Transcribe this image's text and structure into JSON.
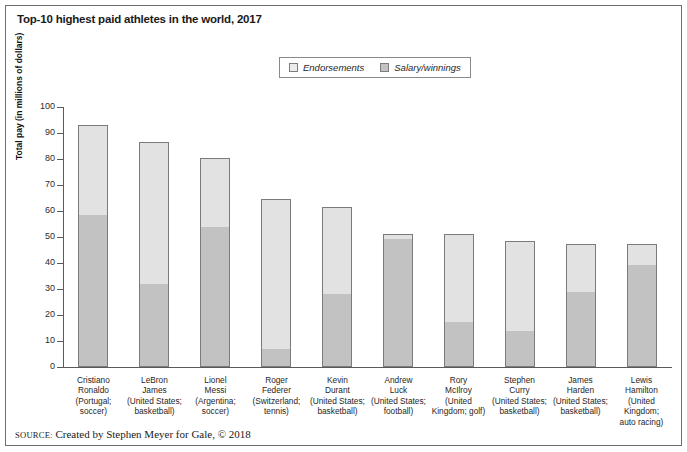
{
  "figure": {
    "title": "Top-10 highest paid athletes in the world, 2017",
    "source_keyword": "SOURCE:",
    "source_text": "Created by Stephen Meyer for Gale, © 2018"
  },
  "colors": {
    "endorsements": "#e2e2e2",
    "salary": "#c2c2c2",
    "bar_border": "#7b7b7b",
    "axis": "#5a5a5a",
    "frame": "#6e6e6e",
    "text": "#1a1a1a"
  },
  "chart_data": {
    "type": "bar",
    "stacked": true,
    "title": "Top-10 highest paid athletes in the world, 2017",
    "xlabel": "",
    "ylabel": "Total pay (in millions of dollars)",
    "ylim": [
      0,
      100
    ],
    "yticks": [
      0,
      10,
      20,
      30,
      40,
      50,
      60,
      70,
      80,
      90,
      100
    ],
    "grid": false,
    "legend_position": "top-center",
    "categories": [
      "Cristiano Ronaldo (Portugal; soccer)",
      "LeBron James (United States; basketball)",
      "Lionel Messi (Argentina; soccer)",
      "Roger Federer (Switzerland; tennis)",
      "Kevin Durant (United States; basketball)",
      "Andrew Luck (United States; football)",
      "Rory McIlroy (United Kingdom; golf)",
      "Stephen Curry (United States; basketball)",
      "James Harden (United States; basketball)",
      "Lewis Hamilton (United Kingdom; auto racing)"
    ],
    "category_lines": [
      [
        "Cristiano",
        "Ronaldo",
        "(Portugal;",
        "soccer)"
      ],
      [
        "LeBron",
        "James",
        "(United States;",
        "basketball)"
      ],
      [
        "Lionel",
        "Messi",
        "(Argentina;",
        "soccer)"
      ],
      [
        "Roger",
        "Federer",
        "(Switzerland;",
        "tennis)"
      ],
      [
        "Kevin",
        "Durant",
        "(United States;",
        "basketball)"
      ],
      [
        "Andrew",
        "Luck",
        "(United States;",
        "football)"
      ],
      [
        "Rory",
        "McIlroy",
        "(United",
        "Kingdom; golf)"
      ],
      [
        "Stephen",
        "Curry",
        "(United States;",
        "basketball)"
      ],
      [
        "James",
        "Harden",
        "(United States;",
        "basketball)"
      ],
      [
        "Lewis",
        "Hamilton",
        "(United Kingdom;",
        "auto racing)"
      ]
    ],
    "series": [
      {
        "name": "Salary/winnings",
        "values": [
          58,
          31.5,
          53.5,
          6.5,
          27.5,
          49,
          17,
          13.5,
          28.5,
          39
        ]
      },
      {
        "name": "Endorsements",
        "values": [
          35,
          55,
          27,
          58,
          34,
          2,
          34,
          35,
          19,
          8.5
        ]
      }
    ],
    "totals": [
      93,
      86.5,
      80.5,
      64.5,
      61.5,
      51,
      51,
      48.5,
      47.5,
      47.5
    ]
  },
  "legend": {
    "items": [
      {
        "label": "Endorsements",
        "key": "endorsements"
      },
      {
        "label": "Salary/winnings",
        "key": "salary"
      }
    ]
  }
}
